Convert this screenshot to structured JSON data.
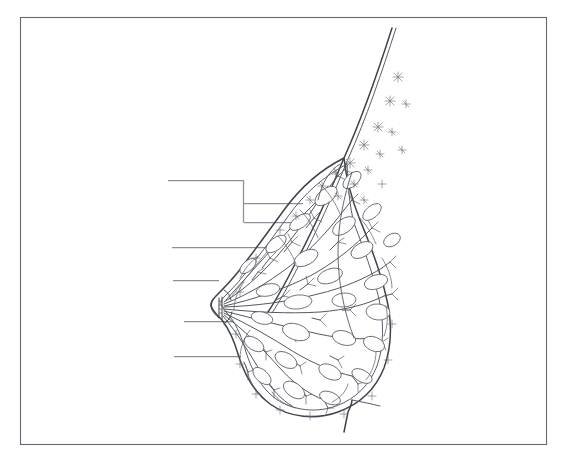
{
  "document": {
    "title": "Breast Anatomy Cross-Section Diagram",
    "kind": "unlabeled-anatomy-worksheet",
    "background_color": "#ffffff",
    "frame": {
      "name": "diagram-border",
      "x": 20,
      "y": 17,
      "width": 526,
      "height": 427,
      "stroke_color": "#666a70"
    },
    "ink_color": "#4a4e55",
    "leader_line_color": "#8b8f96"
  },
  "illustration": {
    "name": "sagittal-breast-cross-section",
    "description": "Side (sagittal) cross-section line drawing of a human breast showing chest wall, fatty adipose tissue, glandular lobules, branching lactiferous ducts converging on the nipple, and suspensory Cooper's ligaments.",
    "orientation": "chest-wall-at-upper-right, nipple-pointing-left",
    "structures": [
      {
        "name": "chest-wall-skin-line",
        "label": ""
      },
      {
        "name": "adipose-fat-cells",
        "label": ""
      },
      {
        "name": "pectoralis-region",
        "label": ""
      },
      {
        "name": "glandular-lobules",
        "label": ""
      },
      {
        "name": "lactiferous-ducts",
        "label": ""
      },
      {
        "name": "lactiferous-sinus",
        "label": ""
      },
      {
        "name": "nipple",
        "label": ""
      },
      {
        "name": "areola",
        "label": ""
      },
      {
        "name": "suspensory-coopers-ligaments",
        "label": ""
      },
      {
        "name": "inframammary-fold",
        "label": ""
      }
    ]
  },
  "leader_lines": [
    {
      "id": "leader-1",
      "label": "",
      "type": "bracket",
      "text_anchor_x": 168,
      "text_anchor_y": 180,
      "points": "168,180 244,180 244,222",
      "branches": [
        {
          "y": 203,
          "x_start": 244,
          "x_end": 300
        },
        {
          "y": 222,
          "x_start": 244,
          "x_end": 300
        }
      ]
    },
    {
      "id": "leader-2",
      "label": "",
      "type": "straight",
      "text_anchor_x": 172,
      "text_anchor_y": 247,
      "points": "172,247 266,247"
    },
    {
      "id": "leader-3",
      "label": "",
      "type": "straight",
      "text_anchor_x": 173,
      "text_anchor_y": 280,
      "points": "173,280 219,280"
    },
    {
      "id": "leader-4",
      "label": "",
      "type": "straight",
      "text_anchor_x": 184,
      "text_anchor_y": 321,
      "points": "184,321 233,321"
    },
    {
      "id": "leader-5",
      "label": "",
      "type": "straight",
      "text_anchor_x": 174,
      "text_anchor_y": 356,
      "points": "174,356 241,356"
    }
  ]
}
